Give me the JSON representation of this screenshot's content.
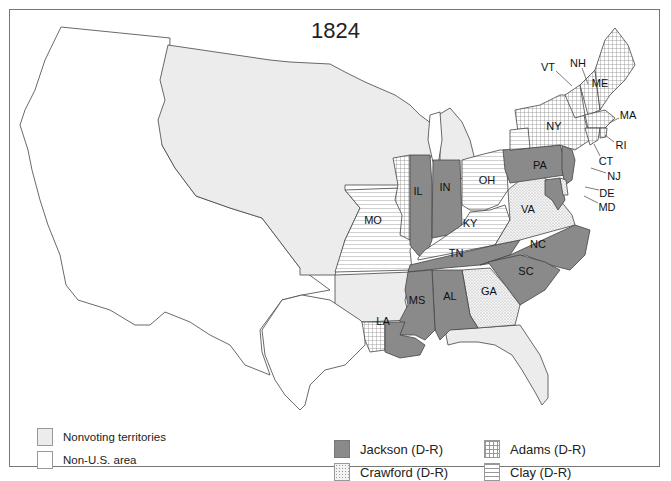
{
  "map": {
    "title": "1824",
    "colors": {
      "jackson": "#8a8a8a",
      "nonvoting": "#ececec",
      "non_us": "#ffffff",
      "border": "#444444"
    },
    "states": [
      {
        "abbr": "ME",
        "candidate": "Adams"
      },
      {
        "abbr": "NH",
        "candidate": "Adams"
      },
      {
        "abbr": "VT",
        "candidate": "Adams"
      },
      {
        "abbr": "MA",
        "candidate": "Adams"
      },
      {
        "abbr": "RI",
        "candidate": "Adams"
      },
      {
        "abbr": "CT",
        "candidate": "Adams"
      },
      {
        "abbr": "NY",
        "candidate": "Adams/Clay/Crawford/Jackson (split)"
      },
      {
        "abbr": "NJ",
        "candidate": "Jackson"
      },
      {
        "abbr": "PA",
        "candidate": "Jackson"
      },
      {
        "abbr": "DE",
        "candidate": "Crawford/Adams (split)"
      },
      {
        "abbr": "MD",
        "candidate": "Jackson/Adams (split)"
      },
      {
        "abbr": "VA",
        "candidate": "Crawford"
      },
      {
        "abbr": "NC",
        "candidate": "Jackson"
      },
      {
        "abbr": "SC",
        "candidate": "Jackson"
      },
      {
        "abbr": "GA",
        "candidate": "Crawford"
      },
      {
        "abbr": "AL",
        "candidate": "Jackson"
      },
      {
        "abbr": "MS",
        "candidate": "Jackson"
      },
      {
        "abbr": "LA",
        "candidate": "Jackson/Adams (split)"
      },
      {
        "abbr": "TN",
        "candidate": "Jackson"
      },
      {
        "abbr": "KY",
        "candidate": "Clay"
      },
      {
        "abbr": "OH",
        "candidate": "Clay"
      },
      {
        "abbr": "IN",
        "candidate": "Jackson"
      },
      {
        "abbr": "IL",
        "candidate": "Jackson/Adams (split)"
      },
      {
        "abbr": "MO",
        "candidate": "Clay"
      }
    ],
    "labels": {
      "ME": "ME",
      "NH": "NH",
      "VT": "VT",
      "MA": "MA",
      "RI": "RI",
      "CT": "CT",
      "NY": "NY",
      "NJ": "NJ",
      "PA": "PA",
      "DE": "DE",
      "MD": "MD",
      "VA": "VA",
      "NC": "NC",
      "SC": "SC",
      "GA": "GA",
      "AL": "AL",
      "MS": "MS",
      "LA": "LA",
      "TN": "TN",
      "KY": "KY",
      "OH": "OH",
      "IN": "IN",
      "IL": "IL",
      "MO": "MO"
    }
  },
  "legend": {
    "area_types": [
      {
        "label": "Nonvoting territories",
        "swatch": "nonvoting"
      },
      {
        "label": "Non-U.S. area",
        "swatch": "non-us"
      }
    ],
    "candidates": [
      {
        "label": "Jackson (D-R)",
        "pattern": "solid-dark-gray"
      },
      {
        "label": "Adams (D-R)",
        "pattern": "crosshatch-grid"
      },
      {
        "label": "Crawford (D-R)",
        "pattern": "stipple-dots"
      },
      {
        "label": "Clay (D-R)",
        "pattern": "horizontal-lines"
      }
    ]
  }
}
